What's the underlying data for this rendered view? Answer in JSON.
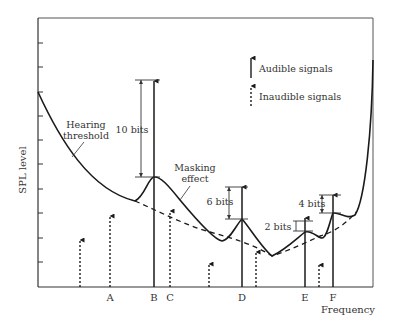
{
  "diagram": {
    "title": "",
    "axes": {
      "x_label": "Frequency",
      "y_label": "SPL level"
    },
    "legend": {
      "audible": "Audible signals",
      "inaudible": "Inaudible signals"
    },
    "curve_labels": {
      "hearing_threshold_line1": "Hearing",
      "hearing_threshold_line2": "threshold",
      "masking_line1": "Masking",
      "masking_line2": "effect"
    },
    "signal_labels": {
      "A": "A",
      "B": "B",
      "C": "C",
      "D": "D",
      "E": "E",
      "F": "F"
    },
    "bit_labels": {
      "B": "10 bits",
      "D": "6 bits",
      "E": "2 bits",
      "F": "4 bits"
    },
    "colors": {
      "line": "#1a1a1a",
      "text": "#333333",
      "frame": "#555555"
    }
  }
}
